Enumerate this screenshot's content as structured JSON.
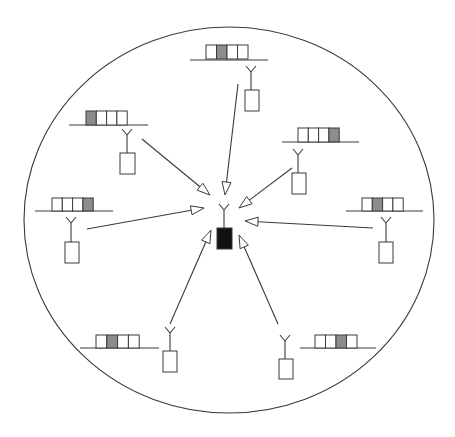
{
  "diagram": {
    "type": "star-network",
    "colors": {
      "line": "#3a3a3a",
      "slot_empty": "#ffffff",
      "slot_assigned": "#8c8c8c",
      "master_device": "#111111",
      "background": "#ffffff"
    },
    "boundary": {
      "shape": "ellipse",
      "cx": 229,
      "cy": 220,
      "rx": 205,
      "ry": 193
    },
    "master": {
      "antenna": {
        "x": 224,
        "y": 210
      },
      "device": {
        "x": 217,
        "y": 228,
        "w": 15,
        "h": 21
      }
    },
    "nodes": [
      {
        "id": "top",
        "frame": {
          "x": 206,
          "y": 45,
          "slots": 4,
          "slot_w": 10.5,
          "h": 14,
          "assigned": 2
        },
        "baseline": {
          "x1": 190,
          "x2": 268,
          "y": 60
        },
        "antenna": {
          "x": 251,
          "y": 72
        },
        "device": {
          "x": 245,
          "y": 90,
          "w": 14,
          "h": 21
        },
        "arrow": {
          "x1": 238,
          "y1": 84,
          "x2": 225,
          "y2": 195
        }
      },
      {
        "id": "upper-left",
        "frame": {
          "x": 86,
          "y": 111,
          "slots": 4,
          "slot_w": 10.3,
          "h": 14,
          "assigned": 1
        },
        "baseline": {
          "x1": 69,
          "x2": 148,
          "y": 125
        },
        "antenna": {
          "x": 127,
          "y": 135
        },
        "device": {
          "x": 120,
          "y": 153,
          "w": 15,
          "h": 21
        },
        "arrow": {
          "x1": 142,
          "y1": 139,
          "x2": 210,
          "y2": 195
        }
      },
      {
        "id": "upper-right",
        "frame": {
          "x": 298,
          "y": 128,
          "slots": 4,
          "slot_w": 10.3,
          "h": 14,
          "assigned": 4
        },
        "baseline": {
          "x1": 282,
          "x2": 359,
          "y": 142
        },
        "antenna": {
          "x": 298,
          "y": 155
        },
        "device": {
          "x": 292,
          "y": 173,
          "w": 14,
          "h": 21
        },
        "arrow": {
          "x1": 292,
          "y1": 168,
          "x2": 239,
          "y2": 208
        }
      },
      {
        "id": "left",
        "frame": {
          "x": 52,
          "y": 198,
          "slots": 4,
          "slot_w": 10.3,
          "h": 13,
          "assigned": 4
        },
        "baseline": {
          "x1": 35,
          "x2": 113,
          "y": 211
        },
        "antenna": {
          "x": 71,
          "y": 223
        },
        "device": {
          "x": 65,
          "y": 242,
          "w": 14,
          "h": 21
        },
        "arrow": {
          "x1": 87,
          "y1": 229,
          "x2": 204,
          "y2": 208
        }
      },
      {
        "id": "right",
        "frame": {
          "x": 362,
          "y": 198,
          "slots": 4,
          "slot_w": 10.3,
          "h": 13,
          "assigned": 2
        },
        "baseline": {
          "x1": 346,
          "x2": 423,
          "y": 211
        },
        "antenna": {
          "x": 386,
          "y": 223
        },
        "device": {
          "x": 379,
          "y": 242,
          "w": 14,
          "h": 21
        },
        "arrow": {
          "x1": 373,
          "y1": 228,
          "x2": 245,
          "y2": 221
        }
      },
      {
        "id": "lower-left",
        "frame": {
          "x": 96,
          "y": 335,
          "slots": 4,
          "slot_w": 10.8,
          "h": 13,
          "assigned": 2
        },
        "baseline": {
          "x1": 80,
          "x2": 159,
          "y": 348
        },
        "antenna": {
          "x": 170,
          "y": 333
        },
        "device": {
          "x": 163,
          "y": 351,
          "w": 14,
          "h": 21
        },
        "arrow": {
          "x1": 170,
          "y1": 324,
          "x2": 211,
          "y2": 230
        }
      },
      {
        "id": "lower-right",
        "frame": {
          "x": 315,
          "y": 335,
          "slots": 4,
          "slot_w": 10.5,
          "h": 13,
          "assigned": 3
        },
        "baseline": {
          "x1": 300,
          "x2": 376,
          "y": 348
        },
        "antenna": {
          "x": 285,
          "y": 341
        },
        "device": {
          "x": 279,
          "y": 359,
          "w": 14,
          "h": 20
        },
        "arrow": {
          "x1": 278,
          "y1": 324,
          "x2": 239,
          "y2": 235
        }
      }
    ]
  }
}
